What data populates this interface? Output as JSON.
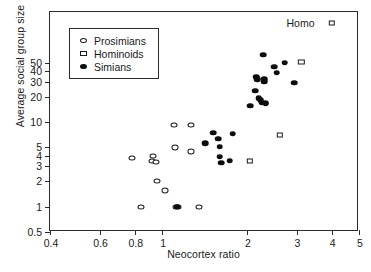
{
  "chart_data": {
    "type": "scatter",
    "title": "",
    "xlabel": "Neocortex ratio",
    "ylabel": "Average social group size",
    "xscale": "log",
    "yscale": "log",
    "xlim": [
      0.4,
      5
    ],
    "ylim": [
      0.5,
      200
    ],
    "grid": false,
    "legend_position": "top-left inside",
    "xticks": [
      {
        "value": 0.4,
        "label": "0.4"
      },
      {
        "value": 0.6,
        "label": "0.6"
      },
      {
        "value": 0.8,
        "label": "0.8"
      },
      {
        "value": 1,
        "label": "1"
      },
      {
        "value": 2,
        "label": "2"
      },
      {
        "value": 3,
        "label": "3"
      },
      {
        "value": 4,
        "label": "4"
      },
      {
        "value": 5,
        "label": "5"
      }
    ],
    "yticks": [
      {
        "value": 0.5,
        "label": "0.5"
      },
      {
        "value": 1,
        "label": "1"
      },
      {
        "value": 2,
        "label": "2"
      },
      {
        "value": 3,
        "label": "3"
      },
      {
        "value": 4,
        "label": "4"
      },
      {
        "value": 5,
        "label": "5"
      },
      {
        "value": 10,
        "label": "10"
      },
      {
        "value": 20,
        "label": "20"
      },
      {
        "value": 30,
        "label": "30"
      },
      {
        "value": 40,
        "label": "40"
      },
      {
        "value": 50,
        "label": "50"
      }
    ],
    "series": [
      {
        "name": "Prosimians",
        "marker": "open-circle",
        "points": [
          [
            0.78,
            3.8
          ],
          [
            0.93,
            4.0
          ],
          [
            0.92,
            3.5
          ],
          [
            0.95,
            3.4
          ],
          [
            0.96,
            2.0
          ],
          [
            1.02,
            1.55
          ],
          [
            1.1,
            9.3
          ],
          [
            1.11,
            5.0
          ],
          [
            1.12,
            1.0
          ],
          [
            1.14,
            1.0
          ],
          [
            0.845,
            1.0
          ],
          [
            1.27,
            9.3
          ],
          [
            1.27,
            4.5
          ],
          [
            1.35,
            1.0
          ]
        ]
      },
      {
        "name": "Hominoids",
        "marker": "open-square",
        "points": [
          [
            2.05,
            3.5
          ],
          [
            2.62,
            7.0
          ],
          [
            3.12,
            51
          ],
          [
            4.0,
            150
          ]
        ]
      },
      {
        "name": "Simians",
        "marker": "filled-circle",
        "points": [
          [
            1.13,
            1.0
          ],
          [
            1.42,
            5.6
          ],
          [
            1.52,
            7.5
          ],
          [
            1.58,
            6.3
          ],
          [
            1.6,
            5.1
          ],
          [
            1.6,
            3.9
          ],
          [
            1.62,
            3.3
          ],
          [
            1.74,
            3.5
          ],
          [
            1.78,
            7.3
          ],
          [
            2.05,
            15.5
          ],
          [
            2.14,
            23.5
          ],
          [
            2.16,
            34
          ],
          [
            2.18,
            32
          ],
          [
            2.2,
            19
          ],
          [
            2.24,
            18
          ],
          [
            2.26,
            17
          ],
          [
            2.28,
            62
          ],
          [
            2.3,
            32
          ],
          [
            2.3,
            30
          ],
          [
            2.32,
            17
          ],
          [
            2.33,
            16.5
          ],
          [
            2.5,
            45
          ],
          [
            2.55,
            38
          ],
          [
            2.72,
            50
          ],
          [
            2.95,
            29
          ]
        ]
      }
    ],
    "annotations": [
      {
        "text": "Homo",
        "x": 3.1,
        "y": 150
      }
    ]
  },
  "legend": {
    "entries": [
      {
        "label": "Prosimians",
        "marker": "open-circle"
      },
      {
        "label": "Hominoids",
        "marker": "open-square"
      },
      {
        "label": "Simians",
        "marker": "filled-circle"
      }
    ]
  }
}
